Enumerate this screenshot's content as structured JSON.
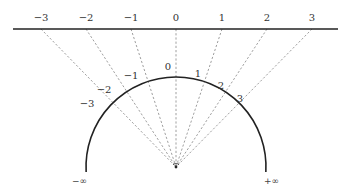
{
  "diagram": {
    "number_line": {
      "y": 29,
      "x_start": 13,
      "x_end": 338,
      "ticks": [
        {
          "label": "−3",
          "x": 41
        },
        {
          "label": "−2",
          "x": 86
        },
        {
          "label": "−1",
          "x": 131
        },
        {
          "label": "0",
          "x": 176
        },
        {
          "label": "1",
          "x": 222
        },
        {
          "label": "2",
          "x": 267
        },
        {
          "label": "3",
          "x": 312
        }
      ]
    },
    "semicircle": {
      "cx": 176,
      "cy": 167,
      "r": 90,
      "arc_labels": [
        {
          "label": "−3",
          "x": 87,
          "y": 107
        },
        {
          "label": "−2",
          "x": 104,
          "y": 93
        },
        {
          "label": "−1",
          "x": 131,
          "y": 79
        },
        {
          "label": "0",
          "x": 168,
          "y": 70
        },
        {
          "label": "1",
          "x": 198,
          "y": 77
        },
        {
          "label": "2",
          "x": 221,
          "y": 89
        },
        {
          "label": "3",
          "x": 240,
          "y": 102
        }
      ],
      "end_labels": {
        "left": "−∞",
        "right": "+∞"
      }
    },
    "colors": {
      "line": "#222222",
      "dashed": "#888888",
      "text": "#333333"
    }
  }
}
